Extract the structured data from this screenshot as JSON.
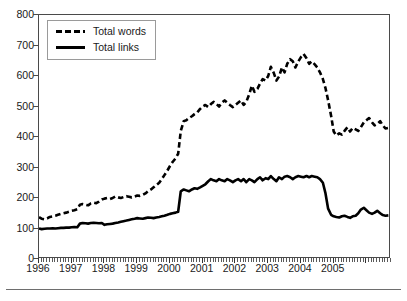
{
  "chart_data": {
    "type": "line",
    "title": "",
    "xlabel": "",
    "ylabel": "",
    "xlim": [
      1996.0,
      2006.75
    ],
    "ylim": [
      0,
      800
    ],
    "grid": false,
    "legend_position": "top-left",
    "xticks": [
      "1996",
      "1997",
      "1998",
      "1999",
      "2000",
      "2001",
      "2002",
      "2003",
      "2004",
      "2005"
    ],
    "xtick_values": [
      1996,
      1997,
      1998,
      1999,
      2000,
      2001,
      2002,
      2003,
      2004,
      2005
    ],
    "yticks": [
      "0",
      "100",
      "200",
      "300",
      "400",
      "500",
      "600",
      "700",
      "800"
    ],
    "ytick_values": [
      0,
      100,
      200,
      300,
      400,
      500,
      600,
      700,
      800
    ],
    "x_minor_tick_interval": 0.0833,
    "series": [
      {
        "name": "Total words",
        "style": "dashed",
        "color": "#000000",
        "x": [
          1996.0,
          1996.08,
          1996.17,
          1996.25,
          1996.33,
          1996.42,
          1996.5,
          1996.58,
          1996.67,
          1996.75,
          1996.83,
          1996.92,
          1997.0,
          1997.08,
          1997.17,
          1997.25,
          1997.33,
          1997.42,
          1997.5,
          1997.58,
          1997.67,
          1997.75,
          1997.83,
          1997.92,
          1998.0,
          1998.08,
          1998.17,
          1998.25,
          1998.33,
          1998.42,
          1998.5,
          1998.58,
          1998.67,
          1998.75,
          1998.83,
          1998.92,
          1999.0,
          1999.08,
          1999.17,
          1999.25,
          1999.33,
          1999.42,
          1999.5,
          1999.58,
          1999.67,
          1999.75,
          1999.83,
          1999.92,
          2000.0,
          2000.08,
          2000.17,
          2000.25,
          2000.33,
          2000.42,
          2000.5,
          2000.58,
          2000.67,
          2000.75,
          2000.83,
          2000.92,
          2001.0,
          2001.08,
          2001.17,
          2001.25,
          2001.33,
          2001.42,
          2001.5,
          2001.58,
          2001.67,
          2001.75,
          2001.83,
          2001.92,
          2002.0,
          2002.08,
          2002.17,
          2002.25,
          2002.33,
          2002.42,
          2002.5,
          2002.58,
          2002.67,
          2002.75,
          2002.83,
          2002.92,
          2003.0,
          2003.08,
          2003.17,
          2003.25,
          2003.33,
          2003.42,
          2003.5,
          2003.58,
          2003.67,
          2003.75,
          2003.83,
          2003.92,
          2004.0,
          2004.08,
          2004.17,
          2004.25,
          2004.33,
          2004.42,
          2004.5,
          2004.58,
          2004.67,
          2004.75,
          2004.83,
          2004.92,
          2005.0,
          2005.08,
          2005.17,
          2005.25,
          2005.33,
          2005.42,
          2005.5,
          2005.58,
          2005.67,
          2005.75,
          2005.83,
          2005.92,
          2006.0,
          2006.08,
          2006.17,
          2006.25,
          2006.33,
          2006.42,
          2006.5,
          2006.58,
          2006.67
        ],
        "y": [
          137,
          132,
          130,
          133,
          138,
          140,
          142,
          145,
          148,
          150,
          152,
          155,
          158,
          160,
          163,
          178,
          180,
          178,
          176,
          182,
          185,
          183,
          188,
          195,
          198,
          200,
          197,
          200,
          205,
          202,
          200,
          203,
          206,
          204,
          202,
          205,
          208,
          207,
          210,
          215,
          222,
          228,
          235,
          242,
          250,
          262,
          275,
          290,
          305,
          318,
          330,
          345,
          420,
          452,
          455,
          462,
          468,
          475,
          480,
          492,
          500,
          505,
          498,
          508,
          515,
          508,
          500,
          512,
          520,
          512,
          505,
          498,
          505,
          512,
          520,
          505,
          515,
          540,
          568,
          548,
          558,
          575,
          590,
          585,
          600,
          630,
          610,
          585,
          598,
          628,
          612,
          640,
          655,
          648,
          628,
          648,
          662,
          672,
          658,
          640,
          648,
          638,
          628,
          612,
          590,
          560,
          520,
          470,
          418,
          405,
          412,
          408,
          420,
          432,
          418,
          430,
          425,
          420,
          432,
          448,
          455,
          462,
          448,
          438,
          442,
          452,
          438,
          428,
          430
        ]
      },
      {
        "name": "Total links",
        "style": "solid",
        "color": "#000000",
        "x": [
          1996.0,
          1996.08,
          1996.17,
          1996.25,
          1996.33,
          1996.42,
          1996.5,
          1996.58,
          1996.67,
          1996.75,
          1996.83,
          1996.92,
          1997.0,
          1997.08,
          1997.17,
          1997.25,
          1997.33,
          1997.42,
          1997.5,
          1997.58,
          1997.67,
          1997.75,
          1997.83,
          1997.92,
          1998.0,
          1998.08,
          1998.17,
          1998.25,
          1998.33,
          1998.42,
          1998.5,
          1998.58,
          1998.67,
          1998.75,
          1998.83,
          1998.92,
          1999.0,
          1999.08,
          1999.17,
          1999.25,
          1999.33,
          1999.42,
          1999.5,
          1999.58,
          1999.67,
          1999.75,
          1999.83,
          1999.92,
          2000.0,
          2000.08,
          2000.17,
          2000.25,
          2000.33,
          2000.42,
          2000.5,
          2000.58,
          2000.67,
          2000.75,
          2000.83,
          2000.92,
          2001.0,
          2001.08,
          2001.17,
          2001.25,
          2001.33,
          2001.42,
          2001.5,
          2001.58,
          2001.67,
          2001.75,
          2001.83,
          2001.92,
          2002.0,
          2002.08,
          2002.17,
          2002.25,
          2002.33,
          2002.42,
          2002.5,
          2002.58,
          2002.67,
          2002.75,
          2002.83,
          2002.92,
          2003.0,
          2003.08,
          2003.17,
          2003.25,
          2003.33,
          2003.42,
          2003.5,
          2003.58,
          2003.67,
          2003.75,
          2003.83,
          2003.92,
          2004.0,
          2004.08,
          2004.17,
          2004.25,
          2004.33,
          2004.42,
          2004.5,
          2004.58,
          2004.67,
          2004.75,
          2004.83,
          2004.92,
          2005.0,
          2005.08,
          2005.17,
          2005.25,
          2005.33,
          2005.42,
          2005.5,
          2005.58,
          2005.67,
          2005.75,
          2005.83,
          2005.92,
          2006.0,
          2006.08,
          2006.17,
          2006.25,
          2006.33,
          2006.42,
          2006.5,
          2006.58,
          2006.67
        ],
        "y": [
          100,
          98,
          99,
          100,
          100,
          101,
          100,
          101,
          102,
          102,
          103,
          103,
          104,
          105,
          104,
          116,
          118,
          117,
          116,
          118,
          119,
          118,
          117,
          118,
          112,
          114,
          115,
          116,
          118,
          120,
          122,
          124,
          126,
          128,
          130,
          132,
          134,
          133,
          132,
          134,
          136,
          135,
          134,
          136,
          138,
          140,
          142,
          145,
          148,
          150,
          152,
          155,
          222,
          228,
          225,
          222,
          228,
          232,
          230,
          235,
          240,
          245,
          255,
          262,
          258,
          255,
          262,
          258,
          255,
          262,
          258,
          252,
          258,
          262,
          255,
          262,
          252,
          262,
          258,
          252,
          262,
          268,
          258,
          265,
          262,
          272,
          262,
          255,
          268,
          262,
          270,
          272,
          268,
          262,
          268,
          272,
          270,
          268,
          272,
          268,
          272,
          270,
          268,
          262,
          250,
          215,
          165,
          145,
          140,
          138,
          136,
          140,
          142,
          138,
          135,
          140,
          142,
          150,
          162,
          168,
          160,
          152,
          148,
          152,
          158,
          150,
          144,
          142,
          143
        ]
      }
    ]
  },
  "legend": {
    "items": [
      {
        "label": "Total words",
        "style": "dashed"
      },
      {
        "label": "Total links",
        "style": "solid"
      }
    ]
  }
}
